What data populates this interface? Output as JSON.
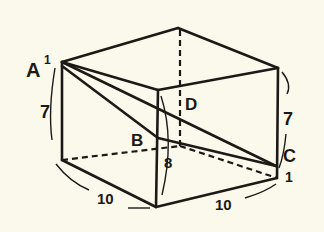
{
  "diagram": {
    "type": "rectangular-prism",
    "background": "#fbf9ec",
    "ink": "#1c1a17",
    "vertex_labels": {
      "a1": "A",
      "a1_sup": "1",
      "b": "B",
      "c": "C",
      "d": "D"
    },
    "dimension_labels": {
      "left_height": "7",
      "right_height": "7",
      "front_height": "8",
      "bottom_left_length": "10",
      "bottom_right_length": "10",
      "corner_mark": "1"
    }
  }
}
